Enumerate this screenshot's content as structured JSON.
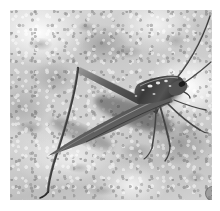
{
  "figure": {
    "panel_label": "1",
    "caption_visible": "",
    "scene": "rock-surface",
    "color_mode": "grayscale"
  },
  "plate": {
    "left": 10,
    "top": 10,
    "width": 202,
    "height": 190,
    "margin_color": "#ffffff",
    "background_color": "#c8c8c8"
  },
  "palette": {
    "page_background": "#ffffff",
    "rock_light": "#f2f2f2",
    "rock_mid": "#c4c4c4",
    "rock_dark": "#6e6e6e",
    "insect_body": "#4a4a4a",
    "insect_highlight": "#e8e8e8",
    "shadow": "#151515",
    "badge_fill": "#787878",
    "badge_text": "#2c2c2c"
  },
  "subject_parts": [
    {
      "name": "left-antenna",
      "description": "long slender antenna sweeping to upper-right corner"
    },
    {
      "name": "right-antenna",
      "description": "second antenna along upper-right edge"
    },
    {
      "name": "head",
      "description": "head at right side of frame"
    },
    {
      "name": "pronotum",
      "description": "saddle-shaped plate behind head with pale speckles"
    },
    {
      "name": "forewing",
      "description": "long tapering wing angled down-left"
    },
    {
      "name": "hind-femur",
      "description": "thick femur angled up-left forming a V"
    },
    {
      "name": "hind-tibia",
      "description": "slender tibia descending to lower-left corner"
    },
    {
      "name": "fore-legs",
      "description": "thin front and middle legs splayed to lower-right"
    },
    {
      "name": "cast-shadow",
      "description": "dark cast shadow beneath head and thorax"
    }
  ]
}
